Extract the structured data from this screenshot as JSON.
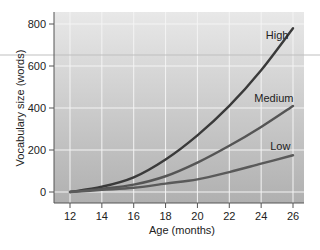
{
  "chart_data": {
    "type": "line",
    "title": "",
    "xlabel": "Age (months)",
    "ylabel": "Vocabulary size (words)",
    "x": [
      12,
      14,
      16,
      18,
      20,
      22,
      24,
      26
    ],
    "xticks": [
      12,
      14,
      16,
      18,
      20,
      22,
      24,
      26
    ],
    "yticks": [
      0,
      200,
      400,
      600,
      800
    ],
    "xlim": [
      11,
      27.2
    ],
    "ylim": [
      -50,
      850
    ],
    "grid": true,
    "legend": "inline labels at line ends",
    "series": [
      {
        "name": "High",
        "values": [
          0,
          25,
          70,
          155,
          270,
          410,
          580,
          780
        ],
        "color": "#3a3a3a"
      },
      {
        "name": "Medium",
        "values": [
          0,
          15,
          35,
          75,
          140,
          220,
          310,
          410
        ],
        "color": "#555555"
      },
      {
        "name": "Low",
        "values": [
          0,
          10,
          20,
          40,
          60,
          95,
          135,
          175
        ],
        "color": "#5a5a5a"
      }
    ],
    "annotations": [
      {
        "text": "High",
        "x": 25.0,
        "y": 730
      },
      {
        "text": "Medium",
        "x": 24.8,
        "y": 430
      },
      {
        "text": "Low",
        "x": 25.2,
        "y": 200
      }
    ]
  },
  "style": {
    "plot_bg_top": "#e6e6e6",
    "plot_bg_bottom": "#b3b3b3",
    "grid_color": "#f4f4f4",
    "axis_color": "#555555",
    "line_color": "#3c3c3c"
  }
}
